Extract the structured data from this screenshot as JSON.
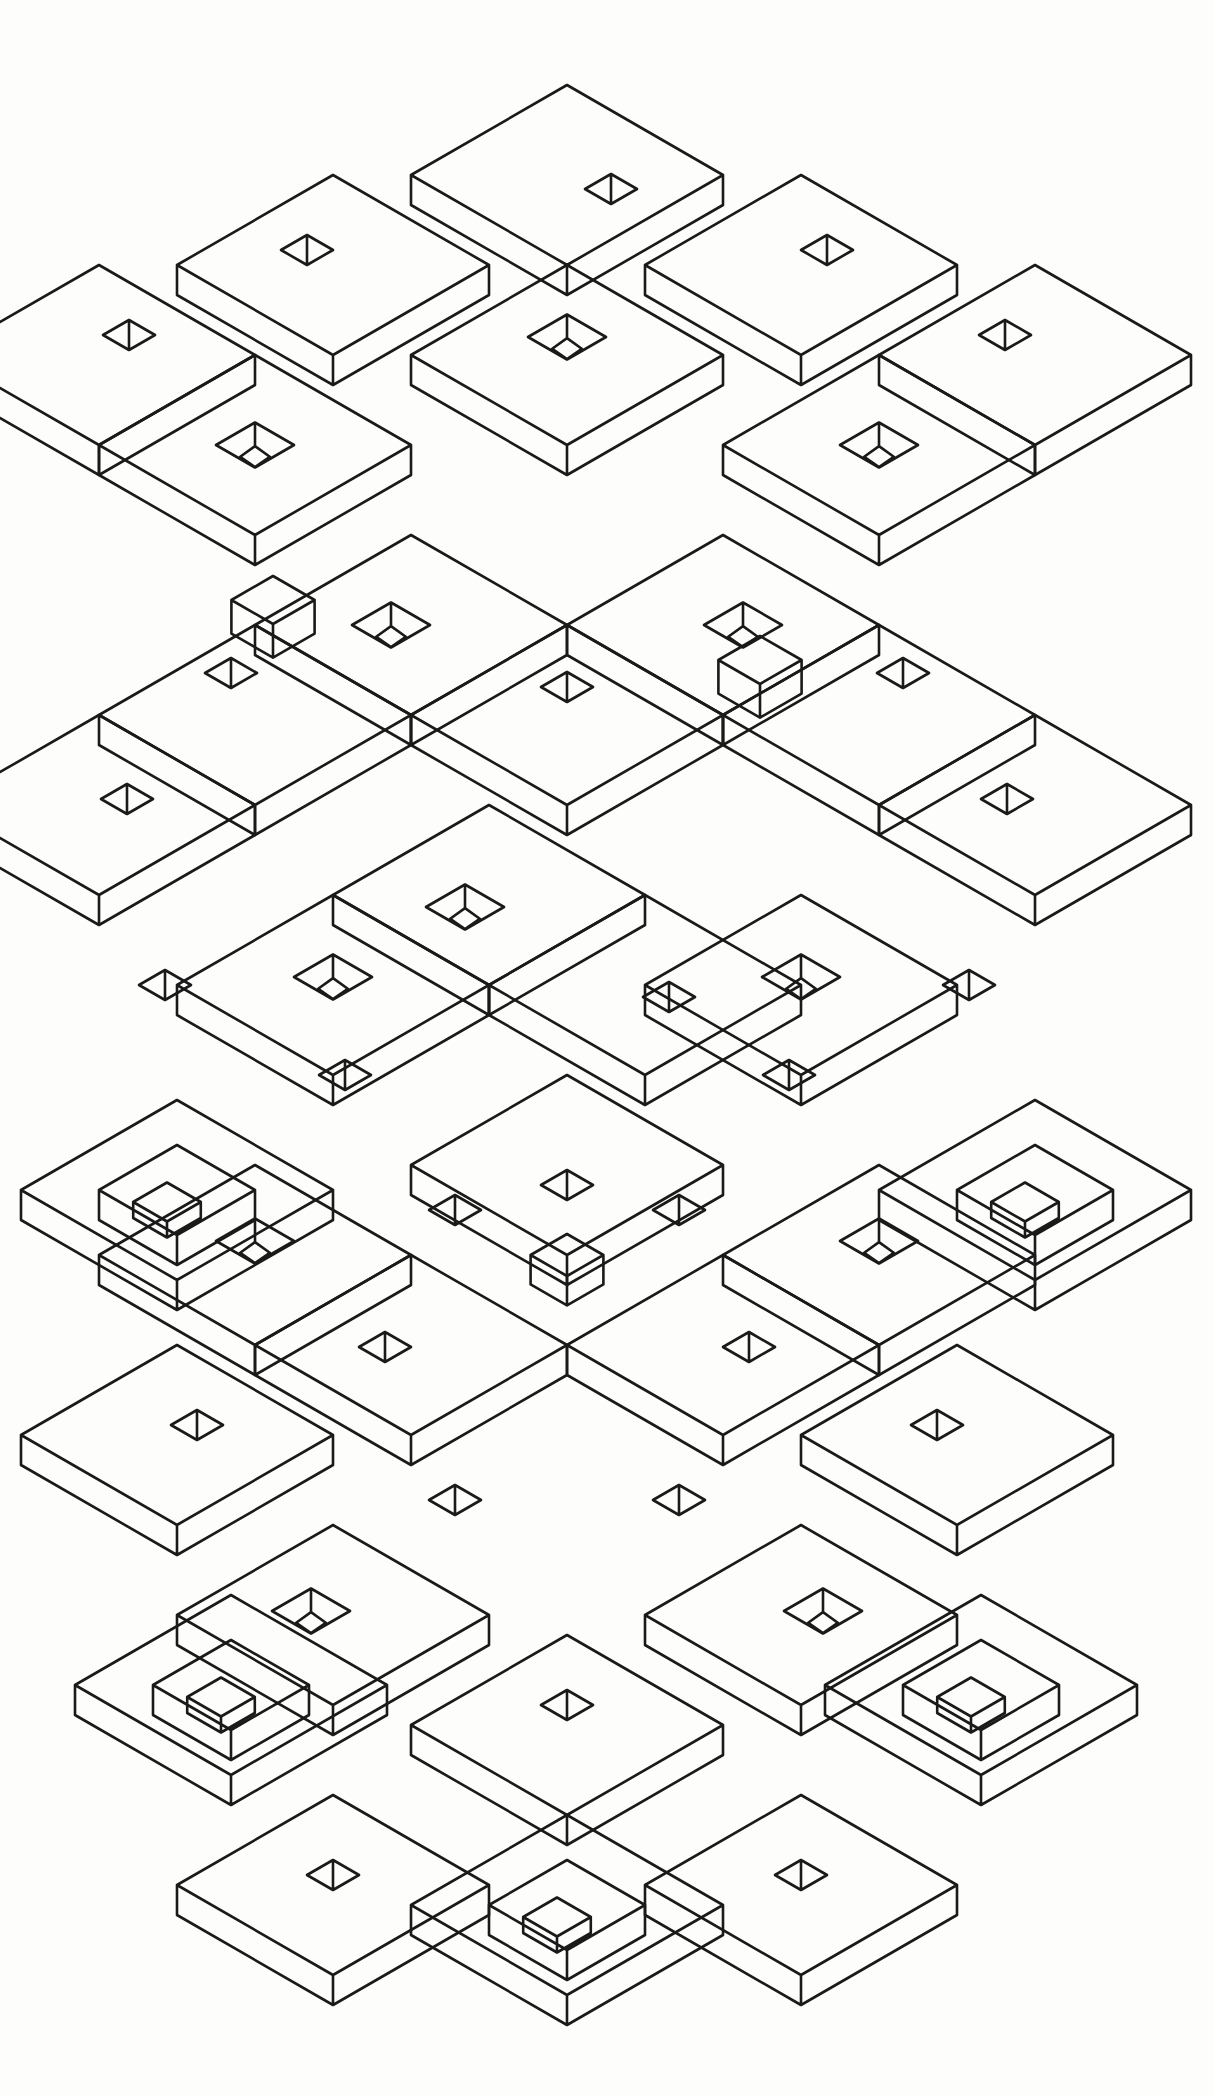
{
  "artwork": {
    "background": "#fdfdfc",
    "ink": "#1a1a1a",
    "stroke_width": 2.6,
    "canvas": {
      "width": 1213,
      "height": 2097
    },
    "iso": {
      "ux": 26,
      "uy": 15,
      "thickness": 30,
      "plate_size": 6
    },
    "plates": [
      {
        "x": 567,
        "y": 175,
        "s": 6,
        "hole": 1.0,
        "ox": 44,
        "oy": 14
      },
      {
        "x": 567,
        "y": 355,
        "s": 6,
        "hole": 1.5,
        "ox": 0,
        "oy": -18
      },
      {
        "x": 333,
        "y": 265,
        "s": 6,
        "hole": 1.0,
        "ox": -26,
        "oy": -15
      },
      {
        "x": 255,
        "y": 445,
        "s": 6,
        "hole": 1.5,
        "ox": 0,
        "oy": 0
      },
      {
        "x": 801,
        "y": 265,
        "s": 6,
        "hole": 1.0,
        "ox": 26,
        "oy": -15
      },
      {
        "x": 879,
        "y": 445,
        "s": 6,
        "hole": 1.5,
        "ox": 0,
        "oy": 0
      },
      {
        "x": 99,
        "y": 355,
        "s": 6,
        "hole": 1.0,
        "ox": 30,
        "oy": -20
      },
      {
        "x": 1035,
        "y": 355,
        "s": 6,
        "hole": 1.0,
        "ox": -30,
        "oy": -20
      },
      {
        "x": 411,
        "y": 625,
        "s": 6,
        "hole": 1.5,
        "ox": -20,
        "oy": 0
      },
      {
        "x": 723,
        "y": 625,
        "s": 6,
        "hole": 1.5,
        "ox": 20,
        "oy": 0
      },
      {
        "x": 567,
        "y": 715,
        "s": 6,
        "hole": 1.0,
        "ox": 0,
        "oy": -28
      },
      {
        "x": 255,
        "y": 715,
        "s": 6,
        "hole": 1.0,
        "ox": -24,
        "oy": -42
      },
      {
        "x": 879,
        "y": 715,
        "s": 6,
        "hole": 1.0,
        "ox": 24,
        "oy": -42
      },
      {
        "x": 99,
        "y": 805,
        "s": 6,
        "hole": 1.0,
        "ox": 28,
        "oy": -6
      },
      {
        "x": 1035,
        "y": 805,
        "s": 6,
        "hole": 1.0,
        "ox": -28,
        "oy": -6
      },
      {
        "x": 489,
        "y": 895,
        "s": 6,
        "hole": 1.5,
        "ox": -24,
        "oy": 12
      },
      {
        "x": 645,
        "y": 985,
        "s": 6,
        "hole": 1.0,
        "ox": 24,
        "oy": 12
      },
      {
        "x": 333,
        "y": 985,
        "s": 6,
        "hole": 1.5,
        "ox": 0,
        "oy": -8
      },
      {
        "x": 801,
        "y": 985,
        "s": 6,
        "hole": 1.5,
        "ox": 0,
        "oy": -8
      },
      {
        "x": 567,
        "y": 1165,
        "s": 6,
        "hole": 1.0,
        "ox": 0,
        "oy": 20
      },
      {
        "x": 255,
        "y": 1255,
        "s": 6,
        "hole": 1.5,
        "ox": 0,
        "oy": -14
      },
      {
        "x": 879,
        "y": 1255,
        "s": 6,
        "hole": 1.5,
        "ox": 0,
        "oy": -14
      },
      {
        "x": 411,
        "y": 1345,
        "s": 6,
        "hole": 1.0,
        "ox": -26,
        "oy": 2
      },
      {
        "x": 723,
        "y": 1345,
        "s": 6,
        "hole": 1.0,
        "ox": 26,
        "oy": 2
      },
      {
        "x": 177,
        "y": 1435,
        "s": 6,
        "hole": 1.0,
        "ox": 20,
        "oy": -10
      },
      {
        "x": 957,
        "y": 1435,
        "s": 6,
        "hole": 1.0,
        "ox": -20,
        "oy": -10
      },
      {
        "x": 567,
        "y": 1725,
        "s": 6,
        "hole": 1.0,
        "ox": 0,
        "oy": -20
      },
      {
        "x": 333,
        "y": 1615,
        "s": 6,
        "hole": 1.5,
        "ox": -22,
        "oy": -4
      },
      {
        "x": 801,
        "y": 1615,
        "s": 6,
        "hole": 1.5,
        "ox": 22,
        "oy": -4
      },
      {
        "x": 333,
        "y": 1885,
        "s": 6,
        "hole": 1.0,
        "ox": 0,
        "oy": -10
      },
      {
        "x": 801,
        "y": 1885,
        "s": 6,
        "hole": 1.0,
        "ox": 0,
        "oy": -10
      }
    ],
    "rings": [
      {
        "x": 177,
        "y": 1190,
        "s": 6,
        "hole": 3,
        "cube": 1.3
      },
      {
        "x": 1035,
        "y": 1190,
        "s": 6,
        "hole": 3,
        "cube": 1.3
      },
      {
        "x": 231,
        "y": 1685,
        "s": 6,
        "hole": 3,
        "cube": 1.3
      },
      {
        "x": 981,
        "y": 1685,
        "s": 6,
        "hole": 3,
        "cube": 1.3
      },
      {
        "x": 567,
        "y": 1905,
        "s": 6,
        "hole": 3,
        "cube": 1.3
      }
    ],
    "floating_holes": [
      {
        "x": 165,
        "y": 985,
        "s": 1
      },
      {
        "x": 969,
        "y": 985,
        "s": 1
      },
      {
        "x": 345,
        "y": 1075,
        "s": 1
      },
      {
        "x": 789,
        "y": 1075,
        "s": 1
      },
      {
        "x": 455,
        "y": 1500,
        "s": 1
      },
      {
        "x": 679,
        "y": 1500,
        "s": 1
      },
      {
        "x": 455,
        "y": 1210,
        "s": 1
      },
      {
        "x": 679,
        "y": 1210,
        "s": 1
      }
    ],
    "cubes": [
      {
        "x": 273,
        "y": 600,
        "s": 1.6
      },
      {
        "x": 760,
        "y": 660,
        "s": 1.6
      },
      {
        "x": 567,
        "y": 1255,
        "s": 1.4
      }
    ]
  }
}
